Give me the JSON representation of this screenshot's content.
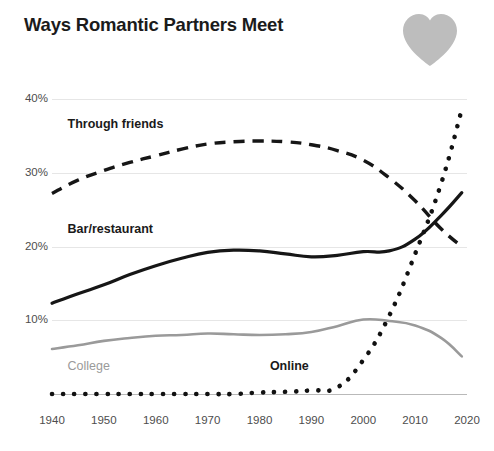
{
  "title": "Ways Romantic Partners Meet",
  "icon": {
    "name": "heart-icon",
    "color": "#bdbdbd"
  },
  "chart_data": {
    "type": "line",
    "title": "Ways Romantic Partners Meet",
    "xlabel": "",
    "ylabel": "",
    "xlim": [
      1940,
      2020
    ],
    "ylim": [
      0,
      40
    ],
    "grid": true,
    "legend": "inline-labels",
    "x_ticks": [
      "1940",
      "1950",
      "1960",
      "1970",
      "1980",
      "1990",
      "2000",
      "2010",
      "2020"
    ],
    "y_ticks": [
      "10%",
      "20%",
      "30%",
      "40%"
    ],
    "y_tick_values": [
      10,
      20,
      30,
      40
    ],
    "x": [
      1940,
      1945,
      1950,
      1955,
      1960,
      1965,
      1970,
      1975,
      1980,
      1985,
      1990,
      1995,
      2000,
      2005,
      2010,
      2015,
      2019
    ],
    "series": [
      {
        "name": "Through friends",
        "style": "dashed",
        "color": "#161616",
        "label_x": 1943,
        "label_y": 36.5,
        "values": [
          27.2,
          29.0,
          30.3,
          31.4,
          32.3,
          33.2,
          33.9,
          34.2,
          34.3,
          34.2,
          33.8,
          33.0,
          31.7,
          29.3,
          26.2,
          22.4,
          20.0
        ]
      },
      {
        "name": "Bar/restaurant",
        "style": "solid",
        "color": "#161616",
        "label_x": 1943,
        "label_y": 22.3,
        "values": [
          12.3,
          13.6,
          14.8,
          16.2,
          17.4,
          18.4,
          19.2,
          19.5,
          19.4,
          19.0,
          18.6,
          18.8,
          19.3,
          19.4,
          21.0,
          24.2,
          27.3
        ]
      },
      {
        "name": "Online",
        "style": "dotted",
        "color": "#111111",
        "label_x": 1982,
        "label_y": 3.6,
        "values": [
          0,
          0,
          0,
          0,
          0,
          0,
          0,
          0,
          0.2,
          0.3,
          0.5,
          0.9,
          4.6,
          10.6,
          19.0,
          28.5,
          38.6
        ]
      },
      {
        "name": "College",
        "style": "solid",
        "color": "#9a9a9a",
        "label_x": 1943,
        "label_y": 3.6,
        "values": [
          6.1,
          6.6,
          7.2,
          7.6,
          7.9,
          8.0,
          8.2,
          8.1,
          8.0,
          8.1,
          8.4,
          9.2,
          10.1,
          9.9,
          9.3,
          7.6,
          5.1
        ]
      }
    ]
  }
}
